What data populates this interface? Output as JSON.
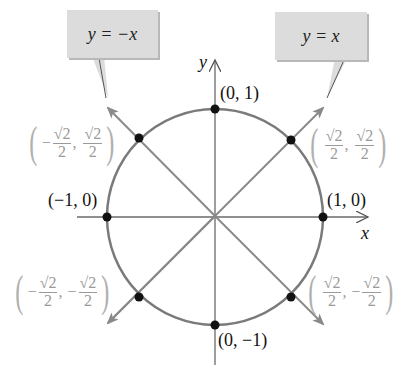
{
  "diagram": {
    "callouts": {
      "left": {
        "text": "y = −x"
      },
      "right": {
        "text": "y = x"
      }
    },
    "axes": {
      "x_label": "x",
      "y_label": "y"
    },
    "points": {
      "top": "(0, 1)",
      "bottom": "(0, −1)",
      "left": "(−1, 0)",
      "right": "(1, 0)",
      "q1": {
        "sign_x": "",
        "num_x": "√2",
        "den_x": "2",
        "sign_y": "",
        "num_y": "√2",
        "den_y": "2"
      },
      "q2": {
        "sign_x": "−",
        "num_x": "√2",
        "den_x": "2",
        "sign_y": "",
        "num_y": "√2",
        "den_y": "2"
      },
      "q3": {
        "sign_x": "−",
        "num_x": "√2",
        "den_x": "2",
        "sign_y": "−",
        "num_y": "√2",
        "den_y": "2"
      },
      "q4": {
        "sign_x": "",
        "num_x": "√2",
        "den_x": "2",
        "sign_y": "−",
        "num_y": "√2",
        "den_y": "2"
      }
    },
    "colors": {
      "circle": "#7a7a7a",
      "axes": "#6a6a6a",
      "diagonals": "#8a8a8a",
      "points": "#111111",
      "callout_bg": "#dcdcdc",
      "gray_label": "#9a9a9a"
    }
  }
}
